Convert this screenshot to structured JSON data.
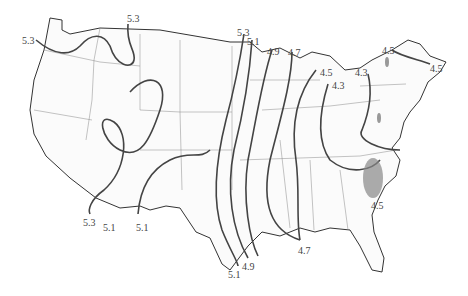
{
  "map": {
    "type": "contour map of contiguous United States",
    "contour_labels": [
      {
        "id": "c1",
        "text": "5.3",
        "x": 22,
        "y": 36
      },
      {
        "id": "c2",
        "text": "5.3",
        "x": 127,
        "y": 14
      },
      {
        "id": "c3",
        "text": "5.3",
        "x": 237,
        "y": 28
      },
      {
        "id": "c4",
        "text": "5.1",
        "x": 247,
        "y": 37
      },
      {
        "id": "c5",
        "text": "4.9",
        "x": 267,
        "y": 47
      },
      {
        "id": "c6",
        "text": "4.7",
        "x": 288,
        "y": 48
      },
      {
        "id": "c7",
        "text": "4.5",
        "x": 320,
        "y": 68
      },
      {
        "id": "c8",
        "text": "4.3",
        "x": 332,
        "y": 81
      },
      {
        "id": "c9",
        "text": "4.3",
        "x": 355,
        "y": 68
      },
      {
        "id": "c10",
        "text": "4.5",
        "x": 382,
        "y": 46
      },
      {
        "id": "c11",
        "text": "4.5",
        "x": 430,
        "y": 64
      },
      {
        "id": "c12",
        "text": "4.5",
        "x": 371,
        "y": 201
      },
      {
        "id": "c13",
        "text": "4.7",
        "x": 298,
        "y": 246
      },
      {
        "id": "c14",
        "text": "4.9",
        "x": 242,
        "y": 262
      },
      {
        "id": "c15",
        "text": "5.1",
        "x": 228,
        "y": 270
      },
      {
        "id": "c16",
        "text": "5.3",
        "x": 83,
        "y": 218
      },
      {
        "id": "c17",
        "text": "5.1",
        "x": 103,
        "y": 223
      },
      {
        "id": "c18",
        "text": "5.1",
        "x": 136,
        "y": 223
      }
    ]
  }
}
